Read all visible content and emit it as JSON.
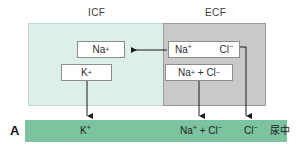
{
  "figure": {
    "panel_letter": "A",
    "compartments": [
      {
        "id": "icf",
        "label": "ICF",
        "fill_color": "#ddf0e7"
      },
      {
        "id": "ecf",
        "label": "ECF",
        "fill_color": "#c9c9c9"
      }
    ],
    "boxes": {
      "icf_sodium": {
        "ion": "Na",
        "charge": "+"
      },
      "icf_potassium": {
        "ion": "K",
        "charge": "+"
      },
      "ecf_sodium": {
        "ion": "Na",
        "charge": "+"
      },
      "ecf_chloride": {
        "ion": "Cl",
        "charge": "−"
      },
      "ecf_sum": {
        "left_ion": "Na",
        "left_charge": "+",
        "operator": "+",
        "right_ion": "Cl",
        "right_charge": "−"
      }
    },
    "urine": {
      "bar_color": "#7cc4a0",
      "note": "尿中",
      "items": [
        {
          "id": "potassium",
          "ion": "K",
          "charge": "+"
        },
        {
          "id": "sodium_chloride",
          "left_ion": "Na",
          "left_charge": "+",
          "operator": "+",
          "right_ion": "Cl",
          "right_charge": "−"
        },
        {
          "id": "chloride",
          "ion": "Cl",
          "charge": "−"
        }
      ]
    },
    "arrows": [
      {
        "id": "ecf-to-icf-sodium",
        "direction": "left"
      },
      {
        "id": "icf-potassium-to-urine",
        "direction": "down"
      },
      {
        "id": "ecf-sum-to-urine",
        "direction": "down"
      },
      {
        "id": "ecf-chloride-to-urine",
        "direction": "down"
      }
    ]
  }
}
